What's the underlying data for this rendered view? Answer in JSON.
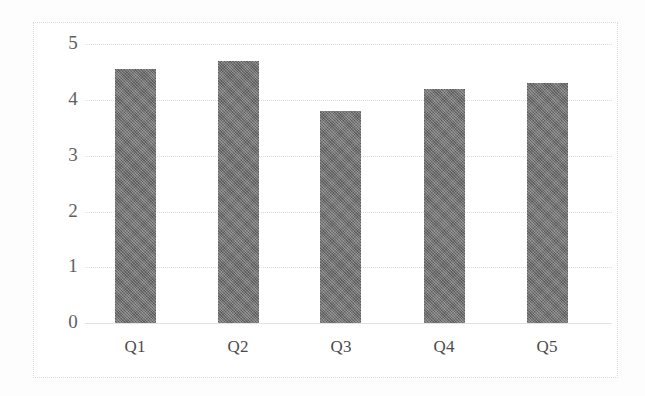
{
  "chart_data": {
    "type": "bar",
    "title": "",
    "subtitle": "",
    "xlabel": "",
    "ylabel": "",
    "categories": [
      "Q1",
      "Q2",
      "Q3",
      "Q4",
      "Q5"
    ],
    "values": [
      4.55,
      4.7,
      3.8,
      4.2,
      4.3
    ],
    "series": [
      {
        "name": "Series 1",
        "values": [
          4.55,
          4.7,
          3.8,
          4.2,
          4.3
        ]
      }
    ],
    "ylim": [
      0,
      5
    ],
    "ytick_labels": [
      "0",
      "1",
      "2",
      "3",
      "4",
      "5"
    ],
    "ytick_values": [
      0,
      1,
      2,
      3,
      4,
      5
    ],
    "grid": true,
    "grid_axis": "y",
    "legend": false,
    "legend_position": "none",
    "bar_color": "#6f6f6f",
    "gridline_color": "#dcdcdc",
    "axis_text_color": "#5f5f5f",
    "plot_background": "#ffffff",
    "frame_color": "#d9d9dd",
    "annotations": []
  }
}
